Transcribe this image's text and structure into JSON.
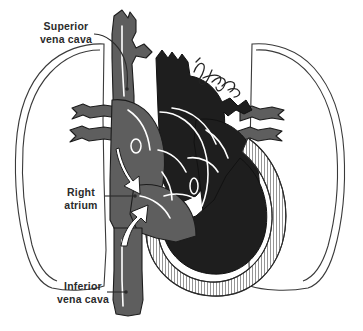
{
  "figure": {
    "background_color": "#ffffff",
    "width": 363,
    "height": 331
  },
  "palette": {
    "vessel_gray": "#5e5e5e",
    "chamber_dark": "#1e1e1e",
    "outline": "#1c1c1c",
    "lung_outline": "#3a3a3a",
    "label_text": "#2b2b2b",
    "highlight": "#ffffff"
  },
  "labels": [
    {
      "id": "superior-vena-cava",
      "line1": "Superior",
      "line2": "vena cava",
      "x": 66,
      "y": 30
    },
    {
      "id": "right-atrium",
      "line1": "Right",
      "line2": "atrium",
      "x": 81,
      "y": 196
    },
    {
      "id": "inferior-vena-cava",
      "line1": "Inferior",
      "line2": "vena cava",
      "x": 83,
      "y": 290
    }
  ],
  "anatomy": {
    "structures": [
      "left lung outline",
      "right lung outline",
      "superior vena cava",
      "inferior vena cava",
      "right atrium",
      "right ventricle",
      "aortic arch",
      "pulmonary artery",
      "pulmonary veins",
      "brachiocephalic veins",
      "myocardium"
    ]
  },
  "signature": {
    "present": true,
    "description": "handwritten artist signature"
  }
}
